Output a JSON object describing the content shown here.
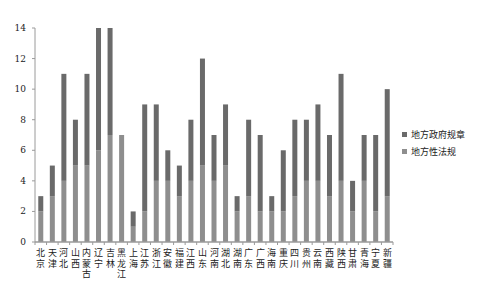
{
  "chart_data": {
    "type": "bar",
    "stacked": true,
    "title": "",
    "xlabel": "",
    "ylabel": "",
    "ylim": [
      0,
      14
    ],
    "yticks": [
      0,
      2,
      4,
      6,
      8,
      10,
      12,
      14
    ],
    "grid": false,
    "legend_position": "right",
    "categories": [
      "北京",
      "天津",
      "河北",
      "山西",
      "内蒙古",
      "辽宁",
      "吉林",
      "黑龙江",
      "上海",
      "江苏",
      "浙江",
      "安徽",
      "福建",
      "江西",
      "山东",
      "河南",
      "湖北",
      "湖南",
      "广东",
      "广西",
      "海南",
      "重庆",
      "四川",
      "贵州",
      "云南",
      "西藏",
      "陕西",
      "甘肃",
      "青海",
      "宁夏",
      "新疆"
    ],
    "series": [
      {
        "name": "地方性法规",
        "color": "#8e8e8e",
        "values": [
          2,
          3,
          4,
          5,
          5,
          6,
          7,
          7,
          1,
          2,
          4,
          4,
          3,
          4,
          5,
          4,
          5,
          2,
          3,
          2,
          2,
          2,
          3,
          4,
          4,
          3,
          4,
          2,
          4,
          2,
          3
        ]
      },
      {
        "name": "地方政府规章",
        "color": "#6a6a6a",
        "values": [
          1,
          2,
          7,
          3,
          6,
          8,
          7,
          0,
          1,
          7,
          5,
          2,
          2,
          4,
          7,
          3,
          4,
          1,
          5,
          5,
          1,
          4,
          5,
          4,
          5,
          4,
          7,
          2,
          3,
          5,
          7
        ]
      }
    ],
    "totals": [
      3,
      5,
      11,
      8,
      11,
      14,
      14,
      7,
      2,
      9,
      9,
      6,
      5,
      8,
      12,
      7,
      9,
      3,
      8,
      7,
      3,
      6,
      8,
      8,
      9,
      7,
      11,
      4,
      7,
      7,
      10
    ]
  },
  "legend": {
    "items": [
      {
        "label": "地方政府规章",
        "color": "#6a6a6a"
      },
      {
        "label": "地方性法规",
        "color": "#8e8e8e"
      }
    ]
  }
}
